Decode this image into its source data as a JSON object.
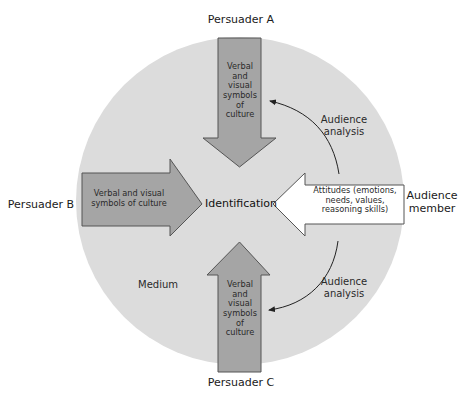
{
  "diagram": {
    "colors": {
      "circle": "#dcdcdc",
      "persuader_arrow_fill": "#a5a5a5",
      "audience_arrow_fill": "#ffffff",
      "stroke": "#555555"
    },
    "center_label": "Identification",
    "persuaders": [
      {
        "label": "Persuader A",
        "arrow_text": "Verbal\nand\nvisual\nsymbols\nof\nculture",
        "direction": "down"
      },
      {
        "label": "Persuader B",
        "arrow_text": "Verbal and visual\nsymbols of culture",
        "direction": "right"
      },
      {
        "label": "Persuader C",
        "arrow_text": "Verbal\nand\nvisual\nsymbols\nof\nculture",
        "direction": "up"
      }
    ],
    "audience": {
      "label": "Audience\nmember",
      "arrow_text": "Attitudes (emotions,\nneeds, values,\nreasoning skills)",
      "direction": "left"
    },
    "feedback_labels": [
      {
        "text": "Audience\nanalysis",
        "position": "upper-right"
      },
      {
        "text": "Audience\nanalysis",
        "position": "lower-right"
      }
    ],
    "medium_label": "Medium"
  }
}
